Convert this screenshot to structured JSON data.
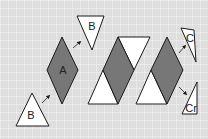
{
  "colors": {
    "background": "#dedede",
    "grid": "#f2f2f2",
    "dark_shape": "#777777",
    "light_shape": "#ffffff",
    "stroke": "#1a1a1a"
  },
  "labels": {
    "rhombus_a": "A",
    "triangle_b_top": "B",
    "triangle_b_bottom": "B",
    "triangle_c": "C",
    "triangle_cr": "Cr"
  }
}
